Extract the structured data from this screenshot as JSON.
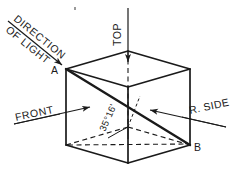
{
  "figure": {
    "type": "engineering-line-drawing",
    "background_color": "#ffffff",
    "line_color": "#1a1a1a",
    "hidden_line_style": "dashed"
  },
  "labels": {
    "direction_of_light_line1": "DIRECTION",
    "direction_of_light_line2": "OF LIGHT",
    "top": "TOP",
    "front": "FRONT",
    "right_side": "R. SIDE",
    "point_a": "A",
    "point_b": "B",
    "angle": "35°16'"
  },
  "geometry": {
    "vertices": {
      "A_top_back_left": [
        66,
        69
      ],
      "top_front_left": [
        128,
        87
      ],
      "top_front_right": [
        190,
        69
      ],
      "top_back_center": [
        128,
        51
      ],
      "bottom_back_left": [
        66,
        145
      ],
      "bottom_front_center": [
        128,
        163
      ],
      "B_bottom_front_right": [
        190,
        145
      ],
      "bottom_back_center": [
        128,
        127
      ]
    },
    "diagonal": {
      "from": "A_top_back_left",
      "to": "B_bottom_front_right"
    },
    "angle_value_degrees": 35,
    "angle_value_minutes": 16,
    "angle_between": "body diagonal and horizontal base plane"
  },
  "arrows": [
    {
      "name": "direction-of-light-arrow",
      "from": [
        8,
        22
      ],
      "to": [
        64,
        67
      ],
      "target": "A"
    },
    {
      "name": "top-view-arrow",
      "from": [
        128,
        8
      ],
      "to": [
        128,
        64
      ],
      "target": "top face"
    },
    {
      "name": "front-view-arrow",
      "from": [
        18,
        123
      ],
      "to": [
        92,
        107
      ],
      "target": "front face"
    },
    {
      "name": "right-side-view-arrow",
      "from": [
        224,
        126
      ],
      "to": [
        150,
        110
      ],
      "target": "right face"
    }
  ]
}
